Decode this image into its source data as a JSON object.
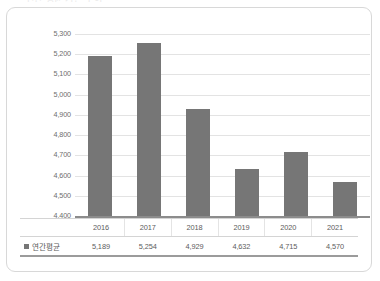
{
  "clipped_header_text": "연간 평균 기온 추이",
  "legend": {
    "series_label": "연간평균",
    "swatch_color": "#767676"
  },
  "axis": {
    "y_ticks": [
      "5,300",
      "5,200",
      "5,100",
      "5,000",
      "4,900",
      "4,800",
      "4,700",
      "4,600",
      "4,500",
      "4,400"
    ]
  },
  "chart_data": {
    "type": "bar",
    "title": "",
    "subtitle": "",
    "xlabel": "",
    "ylabel": "",
    "categories": [
      "2016",
      "2017",
      "2018",
      "2019",
      "2020",
      "2021"
    ],
    "series": [
      {
        "name": "연간평균",
        "values": [
          5189,
          5254,
          4929,
          4632,
          4715,
          4570
        ],
        "value_labels": [
          "5,189",
          "5,254",
          "4,929",
          "4,632",
          "4,715",
          "4,570"
        ],
        "color": "#767676"
      }
    ],
    "ylim": [
      4400,
      5300
    ],
    "y_tick_step": 100,
    "y_tick_values": [
      5300,
      5200,
      5100,
      5000,
      4900,
      4800,
      4700,
      4600,
      4500,
      4400
    ],
    "y_tick_labels": [
      "5,300",
      "5,200",
      "5,100",
      "5,000",
      "4,900",
      "4,800",
      "4,700",
      "4,600",
      "4,500",
      "4,400"
    ],
    "grid": true,
    "grid_axis": "y",
    "legend_position": "bottom-table",
    "data_table_visible": true
  },
  "colors": {
    "bar": "#767676",
    "gridline": "#e3e3e3",
    "baseline": "#8c8c8c",
    "card_border": "#d8d8d8",
    "text": "#5d5d5d",
    "background": "#ffffff"
  }
}
